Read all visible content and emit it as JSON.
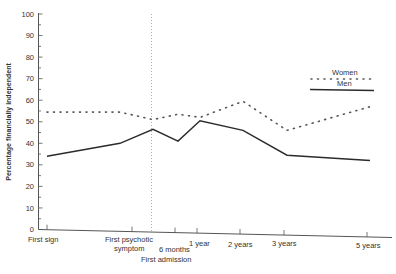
{
  "chart_data": {
    "type": "line",
    "title": "",
    "xlabel": "",
    "ylabel": "Percentage financially independent",
    "ylim": [
      0,
      100
    ],
    "yticks": [
      0,
      10,
      20,
      30,
      40,
      50,
      60,
      70,
      80,
      90,
      100
    ],
    "grid": false,
    "legend_position": "upper right",
    "categories": [
      "First sign",
      "First psychotic symptom",
      "First admission",
      "6 months",
      "1 year",
      "2 years",
      "3 years",
      "5 years"
    ],
    "x_tick_labels": [
      {
        "label": "First sign",
        "lines": [
          "First sign"
        ]
      },
      {
        "label": "First psychotic symptom",
        "lines": [
          "First psychotic",
          "symptom"
        ]
      },
      {
        "label": "First admission",
        "lines": [
          "First admission"
        ]
      },
      {
        "label": "6 months",
        "lines": [
          "6 months"
        ]
      },
      {
        "label": "1 year",
        "lines": [
          "1 year"
        ]
      },
      {
        "label": "2 years",
        "lines": [
          "2 years"
        ]
      },
      {
        "label": "3 years",
        "lines": [
          "3 years"
        ]
      },
      {
        "label": "5 years",
        "lines": [
          "5 years"
        ]
      }
    ],
    "annotations": [
      {
        "type": "vertical-dotted-line",
        "at": "First admission"
      }
    ],
    "series": [
      {
        "name": "Women",
        "style": "dotted",
        "values": [
          54.5,
          54.5,
          51,
          53.5,
          52,
          59.5,
          46,
          57
        ]
      },
      {
        "name": "Men",
        "style": "solid",
        "values": [
          34,
          40,
          46.5,
          41,
          50.5,
          46,
          34.5,
          32
        ]
      }
    ]
  },
  "legend": {
    "women": "Women",
    "men": "Men"
  },
  "axis": {
    "y_title": "Percentage financially independent",
    "y_ticks": [
      "0",
      "10",
      "20",
      "30",
      "40",
      "50",
      "60",
      "70",
      "80",
      "90",
      "100"
    ]
  },
  "x_labels": {
    "first_sign": "First sign",
    "first_psychotic_1": "First psychotic",
    "first_psychotic_2": "symptom",
    "first_admission": "First admission",
    "six_months": "6 months",
    "one_year": "1 year",
    "two_years": "2 years",
    "three_years": "3 years",
    "five_years": "5 years"
  },
  "colors": {
    "line": "#2b2b2b",
    "axis": "#555555",
    "dotted": "#555555",
    "admission_line": "#9a9a9a"
  }
}
